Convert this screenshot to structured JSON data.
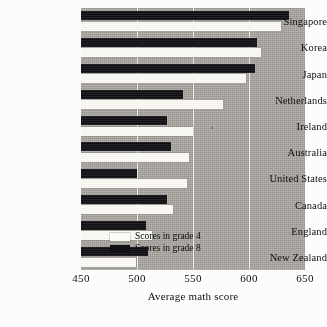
{
  "chart_data": {
    "type": "bar",
    "orientation": "horizontal",
    "title": "",
    "xlabel": "Average math score",
    "ylabel": "",
    "xlim": [
      450,
      650
    ],
    "xticks": [
      450,
      500,
      550,
      600,
      650
    ],
    "grid": true,
    "legend_position": "inside-bottom-right",
    "categories": [
      "Singapore",
      "Korea",
      "Japan",
      "Netherlands",
      "Ireland",
      "Australia",
      "United States",
      "Canada",
      "England",
      "New Zealand"
    ],
    "series": [
      {
        "name": "Scores in grade 4",
        "color": "#f6f5f0",
        "values": [
          629,
          611,
          597,
          577,
          550,
          546,
          545,
          532,
          513,
          499
        ]
      },
      {
        "name": "Scores in grade 8",
        "color": "#17161a",
        "values": [
          636,
          607,
          605,
          541,
          527,
          530,
          500,
          527,
          508,
          510
        ]
      }
    ]
  },
  "axis": {
    "x_title": "Average math score",
    "ticks": [
      "450",
      "500",
      "550",
      "600",
      "650"
    ]
  },
  "legend": {
    "entries": [
      {
        "label": "Scores in grade 4",
        "swatch": "white"
      },
      {
        "label": "Scores in grade 8",
        "swatch": "black"
      }
    ]
  }
}
